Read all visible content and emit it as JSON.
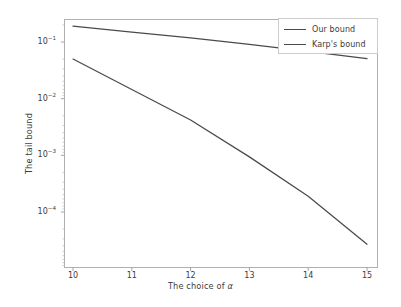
{
  "chart_data": {
    "type": "line",
    "title": "",
    "xlabel": "The choice of α",
    "ylabel": "The tail bound",
    "yscale": "log",
    "xlim": [
      9.75,
      15.25
    ],
    "ylim": [
      1.6e-05,
      0.3
    ],
    "grid": false,
    "legend_position": "upper right",
    "xticks": [
      10,
      11,
      12,
      13,
      14,
      15
    ],
    "xtick_labels": [
      "10",
      "11",
      "12",
      "13",
      "14",
      "15"
    ],
    "yticks": [
      0.1,
      0.01,
      0.001,
      0.0001
    ],
    "ytick_labels": [
      "10⁻¹",
      "10⁻²",
      "10⁻³",
      "10⁻⁴"
    ],
    "ytick_mantissa": "10",
    "ytick_exponents": [
      "-1",
      "-2",
      "-3",
      "-4"
    ],
    "x": [
      10,
      11,
      12,
      13,
      14,
      15
    ],
    "series": [
      {
        "name": "Our bound",
        "color": "#4a4a4a",
        "values": [
          0.05,
          0.0145,
          0.0042,
          0.00094,
          0.00019,
          2.7e-05
        ]
      },
      {
        "name": "Karp's bound",
        "color": "#4a4a4a",
        "values": [
          0.19,
          0.15,
          0.118,
          0.091,
          0.068,
          0.051
        ]
      }
    ]
  },
  "axes": {
    "xlabel": "The choice of α",
    "ylabel": "The tail bound"
  },
  "legend": {
    "entries": [
      {
        "label": "Our bound"
      },
      {
        "label": "Karp's bound"
      }
    ]
  }
}
